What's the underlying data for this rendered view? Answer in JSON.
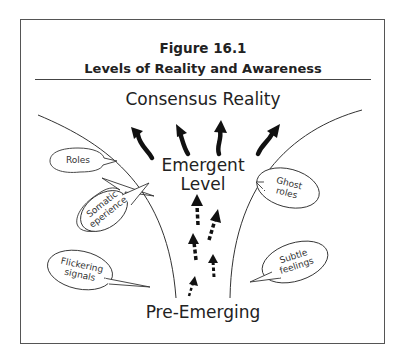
{
  "figure": {
    "number": "Figure 16.1",
    "title": "Levels of Reality and Awareness"
  },
  "levels": {
    "top": "Consensus Reality",
    "middle_line1": "Emergent",
    "middle_line2": "Level",
    "bottom": "Pre-Emerging"
  },
  "bubbles": {
    "left": [
      {
        "line1": "Roles",
        "line2": ""
      },
      {
        "line1": "Somatic",
        "line2": "eperience"
      },
      {
        "line1": "Flickering",
        "line2": "signals"
      }
    ],
    "right": [
      {
        "line1": "Ghost",
        "line2": "roles"
      },
      {
        "line1": "Subtle",
        "line2": "feelings"
      }
    ]
  },
  "arrows": {
    "solid_count": 4,
    "dashed_count": 5,
    "color": "#111111"
  }
}
